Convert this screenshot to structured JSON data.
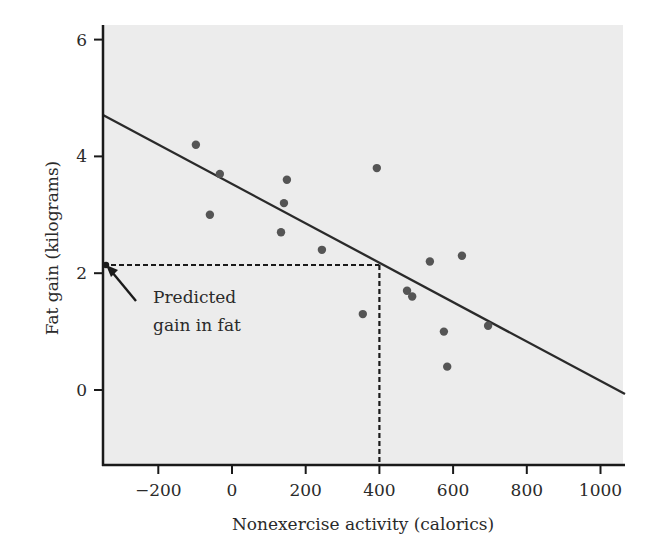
{
  "chart_data": {
    "type": "scatter",
    "title": "",
    "xlabel": "Nonexercise activity (calorics)",
    "ylabel": "Fat gain (kilograms)",
    "xlim": [
      -350,
      1060
    ],
    "ylim": [
      -1.3,
      6.3
    ],
    "x_ticks": [
      -200,
      0,
      200,
      400,
      600,
      800,
      1000
    ],
    "x_tick_labels": [
      "−200",
      "0",
      "200",
      "400",
      "600",
      "800",
      "1000"
    ],
    "y_ticks": [
      0,
      2,
      4,
      6
    ],
    "y_tick_labels": [
      "0",
      "2",
      "4",
      "6"
    ],
    "grid": false,
    "legend": null,
    "series": [
      {
        "name": "Observations",
        "type": "scatter",
        "points": [
          {
            "x": -98,
            "y": 4.2
          },
          {
            "x": -60,
            "y": 3.0
          },
          {
            "x": -33,
            "y": 3.7
          },
          {
            "x": 133,
            "y": 2.7
          },
          {
            "x": 141,
            "y": 3.2
          },
          {
            "x": 149,
            "y": 3.6
          },
          {
            "x": 244,
            "y": 2.4
          },
          {
            "x": 355,
            "y": 1.3
          },
          {
            "x": 393,
            "y": 3.8
          },
          {
            "x": 475,
            "y": 1.7
          },
          {
            "x": 489,
            "y": 1.6
          },
          {
            "x": 537,
            "y": 2.2
          },
          {
            "x": 575,
            "y": 1.0
          },
          {
            "x": 584,
            "y": 0.4
          },
          {
            "x": 624,
            "y": 2.3
          },
          {
            "x": 695,
            "y": 1.1
          }
        ]
      },
      {
        "name": "Least-squares regression line",
        "type": "line",
        "intercept": 3.52,
        "slope": -0.00339,
        "points": [
          {
            "x": -350,
            "y": 4.71
          },
          {
            "x": 1060,
            "y": -0.07
          }
        ]
      }
    ],
    "annotations": [
      {
        "text_lines": [
          "Predicted",
          "gain in fat"
        ],
        "arrow_to": {
          "x": -350,
          "y": 2.14
        },
        "prediction": {
          "x": 400,
          "y": 2.14
        },
        "guide_lines": "dashed"
      }
    ],
    "colors": {
      "plot_background": "#ececec",
      "points": "#555555",
      "line": "#2a2a2a",
      "axes": "#1a1a1a"
    }
  }
}
